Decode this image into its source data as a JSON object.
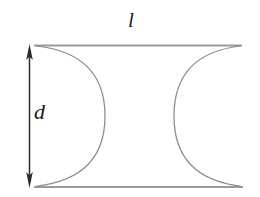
{
  "figure": {
    "name": "concave-sided-profile-diagram",
    "background_color": "#ffffff",
    "labels": {
      "length": "l",
      "diameter": "d"
    },
    "colors": {
      "straight_edge": "#9a9a9a",
      "arc_edge": "#8a8a8a",
      "dimension_arrow": "#2b2b2b",
      "label_text": "#1c1c1c"
    },
    "geometry": {
      "top_edge": {
        "y": 45.5,
        "x_start": 34,
        "x_end": 242,
        "stroke_width": 2.1
      },
      "bottom_edge": {
        "y": 187,
        "x_start": 34,
        "x_end": 243,
        "stroke_width": 2.1
      },
      "left_arc": {
        "start_x": 37,
        "start_y": 46,
        "apex_x": 105,
        "apex_y": 116,
        "end_x": 37,
        "end_y": 186,
        "bulge_direction": "right",
        "stroke_width": 1.25
      },
      "right_arc": {
        "start_x": 240,
        "start_y": 46,
        "apex_x": 174,
        "apex_y": 116,
        "end_x": 240,
        "end_y": 186,
        "bulge_direction": "left",
        "stroke_width": 1.25
      },
      "dimension_arrow": {
        "x": 29.5,
        "y_top": 45,
        "y_bottom": 187,
        "shaft_width": 1.5,
        "head_width": 7,
        "head_length": 14,
        "double_headed": true
      }
    }
  }
}
